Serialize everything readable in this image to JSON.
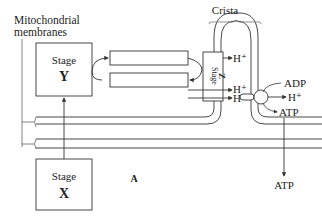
{
  "labels": {
    "membranes_line1": "Mitochondrial",
    "membranes_line2": "membranes",
    "crista": "Crista",
    "stage_y_word": "Stage",
    "stage_y_letter": "Y",
    "stage_x_word": "Stage",
    "stage_x_letter": "X",
    "stage_z_word": "Stage",
    "stage_z_letter": "Z",
    "h_plus_top": "H⁺",
    "h_plus_mid": "H⁺",
    "h_plus_low": "H⁺",
    "h_plus_right": "H⁺",
    "adp": "ADP",
    "atp_upper": "ATP",
    "atp_lower": "ATP",
    "region_a": "A"
  },
  "colors": {
    "line": "#333333",
    "membrane_fill": "#ffffff",
    "background": "#ffffff"
  }
}
